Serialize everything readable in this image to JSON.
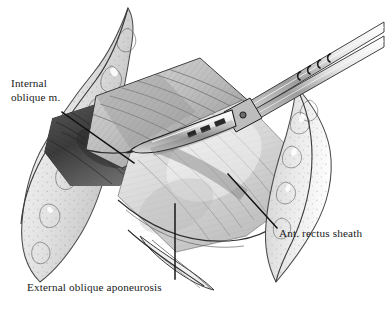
{
  "figure": {
    "kind": "medical-illustration",
    "medium": "graphite pencil drawing",
    "background_color": "#ffffff",
    "ink_color": "#1a1a1a"
  },
  "labels": {
    "internal_oblique": {
      "line1": "Internal",
      "line2": "oblique m."
    },
    "ant_rectus_sheath": "Ant. rectus sheath",
    "external_oblique_aponeurosis": "External oblique aponeurosis"
  },
  "structures": [
    {
      "name": "internal-oblique-muscle",
      "label": "Internal oblique m."
    },
    {
      "name": "anterior-rectus-sheath",
      "label": "Ant. rectus sheath"
    },
    {
      "name": "external-oblique-aponeurosis",
      "label": "External oblique aponeurosis"
    },
    {
      "name": "subcutaneous-fat-edge",
      "label": ""
    },
    {
      "name": "surgical-forceps",
      "label": ""
    }
  ],
  "leader_lines": [
    {
      "name": "leader-internal-oblique",
      "from": [
        62,
        112
      ],
      "to": [
        134,
        163
      ]
    },
    {
      "name": "leader-ant-rectus-sheath",
      "from": [
        277,
        228
      ],
      "to": [
        228,
        174
      ]
    },
    {
      "name": "leader-external-oblique-aponeurosis",
      "from": [
        175,
        279
      ],
      "to": [
        175,
        204
      ]
    }
  ]
}
